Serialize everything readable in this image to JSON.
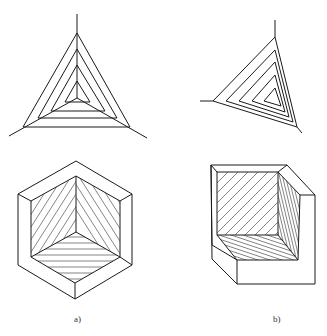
{
  "figure": {
    "panels": [
      {
        "id": "a",
        "label": "a)",
        "top_view": "nested equilateral triangles with three radial axes",
        "bottom_view": "hexagonal recessed cube corner with three hatched faces"
      },
      {
        "id": "b",
        "label": "b)",
        "top_view": "nested skewed triangles with radial axes",
        "bottom_view": "recessed cube corner viewed obliquely with three hatched faces"
      }
    ],
    "colors": {
      "line": "#1a1a1a",
      "background": "#ffffff"
    }
  }
}
